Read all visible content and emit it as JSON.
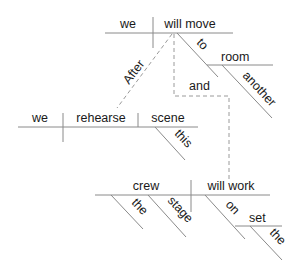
{
  "diagram": {
    "type": "sentence-diagram",
    "main_clause": {
      "subject": "we",
      "verb": "will move",
      "preposition": "to",
      "object_of_preposition": "room",
      "modifier": "another"
    },
    "subordinate_clause": {
      "conjunction": "After",
      "subject": "we",
      "verb": "rehearse",
      "direct_object": "scene",
      "modifier": "this"
    },
    "compound_clause": {
      "conjunction": "and",
      "subject": "crew",
      "subject_modifiers": [
        "the",
        "stage"
      ],
      "verb": "will work",
      "preposition": "on",
      "object_of_preposition": "set",
      "object_modifier": "the"
    }
  }
}
